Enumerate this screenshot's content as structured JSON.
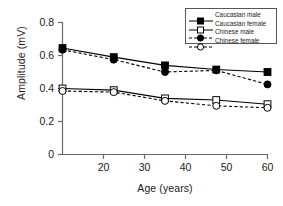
{
  "chart_data": {
    "type": "line",
    "title": "",
    "xlabel": "Age (years)",
    "ylabel": "Amplitude (mV)",
    "x": [
      20,
      30,
      40,
      50,
      60
    ],
    "xticklabels": [
      "20",
      "30",
      "40",
      "50",
      "60"
    ],
    "yticklabels": [
      "0",
      "0.2",
      "0.4",
      "0.6",
      "0.8"
    ],
    "yticks": [
      0,
      0.2,
      0.4,
      0.6,
      0.8
    ],
    "xlim": [
      15,
      65
    ],
    "ylim": [
      0,
      0.8
    ],
    "grid": false,
    "legend_position": "upper right",
    "series": [
      {
        "name": "Caucasian male",
        "values": [
          0.645,
          0.59,
          0.54,
          0.515,
          0.5
        ],
        "marker": "filled-square",
        "line": "solid",
        "color": "#000000"
      },
      {
        "name": "Caucasian female",
        "values": [
          0.4,
          0.39,
          0.34,
          0.33,
          0.305
        ],
        "marker": "open-square",
        "line": "solid",
        "color": "#000000"
      },
      {
        "name": "Chinese male",
        "values": [
          0.635,
          0.575,
          0.5,
          0.51,
          0.425
        ],
        "marker": "filled-circle",
        "line": "dashed",
        "color": "#000000"
      },
      {
        "name": "Chinese female",
        "values": [
          0.385,
          0.378,
          0.325,
          0.295,
          0.283
        ],
        "marker": "open-circle",
        "line": "dashed",
        "color": "#000000"
      }
    ]
  },
  "axes": {
    "ylabel": "Amplitude (mV)",
    "xlabel": "Age (years)",
    "ytick_0": "0",
    "ytick_1": "0.2",
    "ytick_2": "0.4",
    "ytick_3": "0.6",
    "ytick_4": "0.8",
    "xtick_0": "20",
    "xtick_1": "30",
    "xtick_2": "40",
    "xtick_3": "50",
    "xtick_4": "60"
  },
  "legend": {
    "items": [
      {
        "label": "Caucasian male"
      },
      {
        "label": "Caucasian female"
      },
      {
        "label": "Chinese male"
      },
      {
        "label": "Chinese female"
      }
    ]
  }
}
